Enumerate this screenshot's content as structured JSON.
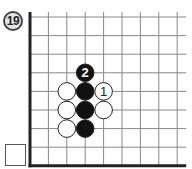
{
  "problem": {
    "number_label": "19"
  },
  "board": {
    "grid": {
      "origin_x": 30,
      "origin_y": 17,
      "spacing_x": 18.4,
      "spacing_y": 18.6,
      "columns": 9,
      "rows": 9,
      "line_color": "#888888",
      "edge_color": "#222222",
      "edges": [
        "left",
        "bottom"
      ]
    },
    "stones": [
      {
        "color": "black",
        "col": 3,
        "row": 3,
        "label": "2"
      },
      {
        "color": "white",
        "col": 2,
        "row": 4,
        "label": ""
      },
      {
        "color": "black",
        "col": 3,
        "row": 4,
        "label": ""
      },
      {
        "color": "white",
        "col": 4,
        "row": 4,
        "label": "1"
      },
      {
        "color": "white",
        "col": 2,
        "row": 5,
        "label": ""
      },
      {
        "color": "black",
        "col": 3,
        "row": 5,
        "label": ""
      },
      {
        "color": "white",
        "col": 4,
        "row": 5,
        "label": ""
      },
      {
        "color": "white",
        "col": 2,
        "row": 6,
        "label": ""
      },
      {
        "color": "black",
        "col": 3,
        "row": 6,
        "label": ""
      }
    ]
  },
  "answer_box": {
    "value": ""
  }
}
